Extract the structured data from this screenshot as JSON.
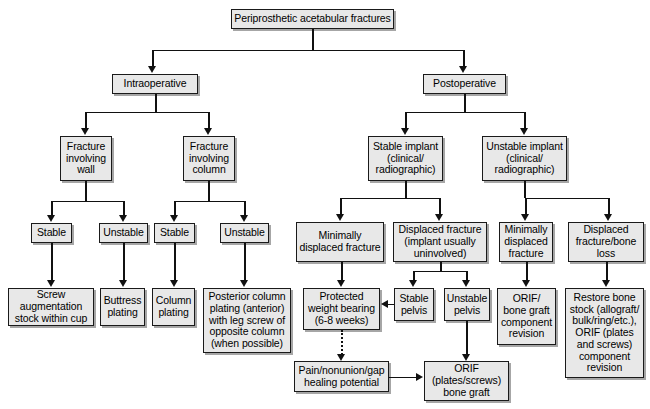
{
  "diagram": {
    "nodes": {
      "root": "Periprosthetic acetabular fractures",
      "intraoperative": "Intraoperative",
      "postoperative": "Postoperative",
      "fracture_wall": "Fracture\ninvolving\nwall",
      "fracture_column": "Fracture\ninvolving\ncolumn",
      "wall_stable": "Stable",
      "wall_unstable": "Unstable",
      "column_stable": "Stable",
      "column_unstable": "Unstable",
      "screw_augmentation": "Screw\naugmentation\nstock within cup",
      "buttress_plating": "Buttress\nplating",
      "column_plating": "Column\nplating",
      "posterior_column_plating": "Posterior column\nplating (anterior)\nwith leg screw of\nopposite column\n(when possible)",
      "stable_implant": "Stable implant\n(clinical/\nradiographic)",
      "unstable_implant": "Unstable implant\n(clinical/\nradiographic)",
      "stable_minimally_displaced": "Minimally\ndisplaced fracture",
      "stable_displaced": "Displaced fracture\n(implant usually\nuninvolved)",
      "unstable_minimally_displaced": "Minimally\ndisplaced\nfracture",
      "unstable_displaced": "Displaced\nfracture/bone\nloss",
      "protected_weight_bearing": "Protected\nweight bearing\n(6-8 weeks)",
      "stable_pelvis": "Stable\npelvis",
      "unstable_pelvis": "Unstable\npelvis",
      "orif_bone_graft_revision": "ORIF/\nbone graft\ncomponent\nrevision",
      "restore_bone_stock": "Restore bone\nstock (allograft/\nbulk/ring/etc.),\nORIF (plates\nand screws)\ncomponent\nrevision",
      "pain_nonunion": "Pain/nonunion/gap\nhealing potential",
      "orif_plates_screws": "ORIF\n(plates/screws)\nbone graft"
    },
    "colors": {
      "node_fill": "#e8e8e8",
      "node_border": "#1a1a1a",
      "connector": "#111111",
      "background": "#ffffff"
    }
  }
}
